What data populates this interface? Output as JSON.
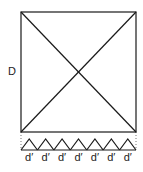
{
  "diagram": {
    "side_label": "D",
    "segment_label": "d′",
    "segment_count": 7,
    "stroke_color": "#1a1a1a"
  }
}
